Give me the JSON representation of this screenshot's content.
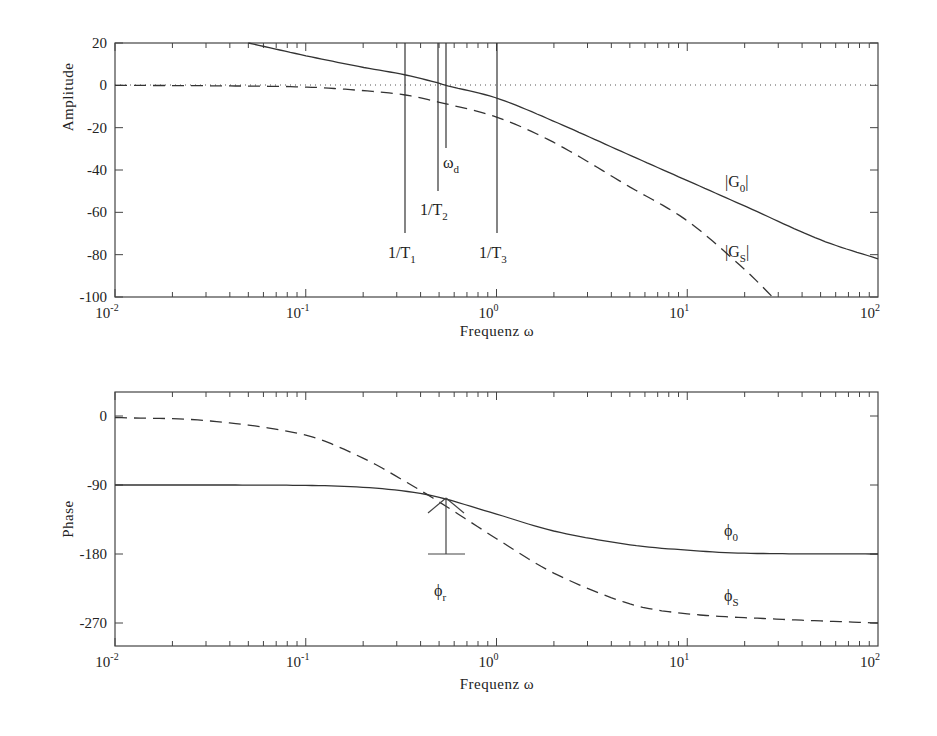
{
  "chart_data": [
    {
      "type": "line",
      "title": "",
      "xlabel": "Frequenz ω",
      "ylabel": "Amplitude",
      "xscale": "log",
      "xlim": [
        0.01,
        100
      ],
      "ylim": [
        -100,
        20
      ],
      "x_ticks": [
        "10^-2",
        "10^-1",
        "10^0",
        "10^1",
        "10^2"
      ],
      "y_ticks": [
        20,
        0,
        -20,
        -40,
        -60,
        -80,
        -100
      ],
      "grid": false,
      "reference_line": {
        "y": 0,
        "style": "dotted"
      },
      "series": [
        {
          "name": "|G0|",
          "style": "solid",
          "x": [
            0.05,
            0.1,
            0.2,
            0.33,
            0.5,
            0.54,
            1,
            2,
            5,
            10,
            20,
            50,
            100
          ],
          "y": [
            20,
            14,
            8.5,
            5,
            1,
            0,
            -6,
            -17,
            -33,
            -45,
            -57,
            -73,
            -82
          ]
        },
        {
          "name": "|GS|",
          "style": "dashed",
          "x": [
            0.01,
            0.03,
            0.1,
            0.2,
            0.33,
            0.5,
            1,
            2,
            5,
            10,
            20,
            28
          ],
          "y": [
            0,
            -0.2,
            -0.8,
            -2.5,
            -4.5,
            -8,
            -15,
            -27,
            -48,
            -64,
            -87,
            -100
          ]
        }
      ],
      "annotations": [
        {
          "label": "1/T1",
          "x": 0.33,
          "line_from": 5,
          "line_to": -70
        },
        {
          "label": "1/T2",
          "x": 0.5,
          "line_from": 20,
          "line_to": -50
        },
        {
          "label": "ωd",
          "x": 0.54,
          "line_from": 20,
          "line_to": -30
        },
        {
          "label": "1/T3",
          "x": 1.0,
          "line_from": 20,
          "line_to": -70
        }
      ]
    },
    {
      "type": "line",
      "title": "",
      "xlabel": "Frequenz ω",
      "ylabel": "Phase",
      "xscale": "log",
      "xlim": [
        0.01,
        100
      ],
      "ylim": [
        -300,
        30
      ],
      "x_ticks": [
        "10^-2",
        "10^-1",
        "10^0",
        "10^1",
        "10^2"
      ],
      "y_ticks": [
        0,
        -90,
        -180,
        -270
      ],
      "grid": false,
      "series": [
        {
          "name": "φ0",
          "style": "solid",
          "x": [
            0.01,
            0.1,
            0.2,
            0.33,
            0.5,
            1,
            2,
            5,
            10,
            20,
            100
          ],
          "y": [
            -90,
            -90.5,
            -93,
            -98,
            -106,
            -128,
            -150,
            -168,
            -175,
            -179,
            -180
          ]
        },
        {
          "name": "φS",
          "style": "dashed",
          "x": [
            0.01,
            0.03,
            0.1,
            0.2,
            0.33,
            0.5,
            1,
            2,
            5,
            10,
            30,
            100
          ],
          "y": [
            -2,
            -6,
            -25,
            -55,
            -85,
            -112,
            -160,
            -205,
            -245,
            -258,
            -265,
            -270
          ]
        }
      ],
      "annotations": [
        {
          "label": "φr",
          "x": 0.54,
          "from": -180,
          "to": -107,
          "type": "arrow"
        }
      ]
    }
  ],
  "top": {
    "ylabel": "Amplitude",
    "xlabel": "Frequenz ω",
    "yticks": [
      "20",
      "0",
      "-20",
      "-40",
      "-60",
      "-80",
      "-100"
    ],
    "labels": {
      "T1": "1/T",
      "T1_sub": "1",
      "T2": "1/T",
      "T2_sub": "2",
      "T3": "1/T",
      "T3_sub": "3",
      "wd": "ω",
      "wd_sub": "d",
      "G0": "|G",
      "G0_sub": "0",
      "G0_end": "|",
      "GS": "|G",
      "GS_sub": "S",
      "GS_end": "|"
    }
  },
  "bottom": {
    "ylabel": "Phase",
    "xlabel": "Frequenz ω",
    "yticks": [
      "0",
      "-90",
      "-180",
      "-270"
    ],
    "labels": {
      "phi0": "ϕ",
      "phi0_sub": "0",
      "phiS": "ϕ",
      "phiS_sub": "S",
      "phir": "ϕ",
      "phir_sub": "r"
    }
  },
  "xticks": {
    "base": "10",
    "exps": [
      "-2",
      "-1",
      "0",
      "1",
      "2"
    ]
  }
}
